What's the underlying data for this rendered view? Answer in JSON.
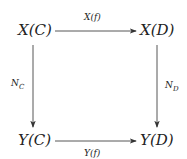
{
  "diagram": {
    "type": "commutative-square",
    "nodes": {
      "top_left": "X(C)",
      "top_right": "X(D)",
      "bottom_left": "Y(C)",
      "bottom_right": "Y(D)"
    },
    "arrows": {
      "top": {
        "label": "X(f)",
        "from": "X(C)",
        "to": "X(D)"
      },
      "bottom": {
        "label": "Y(f)",
        "from": "Y(C)",
        "to": "Y(D)"
      },
      "left": {
        "label_main": "N",
        "label_sub": "C",
        "from": "X(C)",
        "to": "Y(C)"
      },
      "right": {
        "label_main": "N",
        "label_sub": "D",
        "from": "X(D)",
        "to": "Y(D)"
      }
    }
  }
}
